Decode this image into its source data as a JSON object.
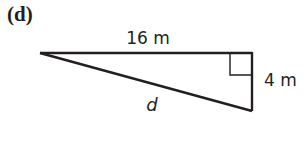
{
  "figure": {
    "part_label": "(d)",
    "shape": "right-triangle",
    "labels": {
      "top_side": "16 m",
      "right_side": "4 m",
      "hypotenuse": "d"
    },
    "colors": {
      "line": "#231f20",
      "background": "#ffffff"
    }
  }
}
